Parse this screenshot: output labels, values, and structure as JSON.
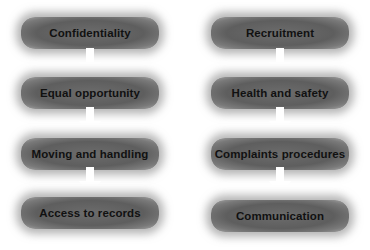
{
  "diagram": {
    "colors": {
      "box_fill": "#636363",
      "box_text": "#111111",
      "arrow": "#ffffff",
      "background": "#ffffff"
    },
    "columns": [
      {
        "name": "left",
        "steps": [
          {
            "label": "Confidentiality"
          },
          {
            "label": "Equal opportunity"
          },
          {
            "label": "Moving and handling"
          },
          {
            "label": "Access to records"
          }
        ]
      },
      {
        "name": "right",
        "steps": [
          {
            "label": "Recruitment"
          },
          {
            "label": "Health and safety"
          },
          {
            "label": "Complaints procedures"
          },
          {
            "label": "Communication"
          }
        ]
      }
    ],
    "connector_icon": "down-arrow-icon"
  }
}
